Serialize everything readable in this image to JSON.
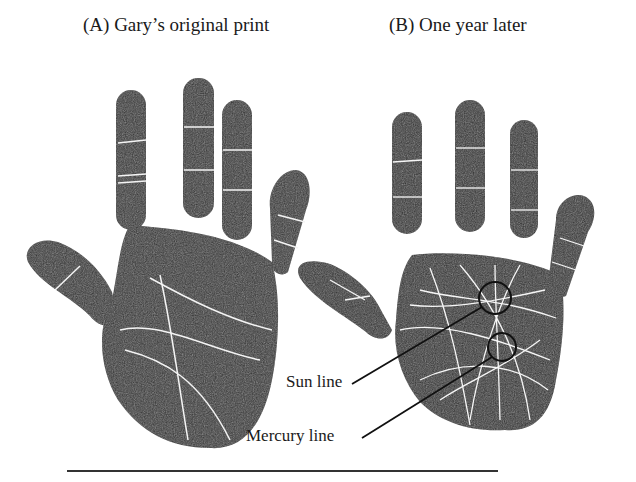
{
  "figure": {
    "panels": [
      {
        "id": "A",
        "caption": "(A) Gary’s original print"
      },
      {
        "id": "B",
        "caption": "(B) One year later"
      }
    ],
    "annotations": [
      {
        "label": "Sun line",
        "icon": "circle-marker"
      },
      {
        "label": "Mercury line",
        "icon": "circle-marker"
      }
    ],
    "colors": {
      "ink": "#2b2b2b",
      "paper": "#ffffff",
      "crease": "#f2f2f2"
    }
  }
}
